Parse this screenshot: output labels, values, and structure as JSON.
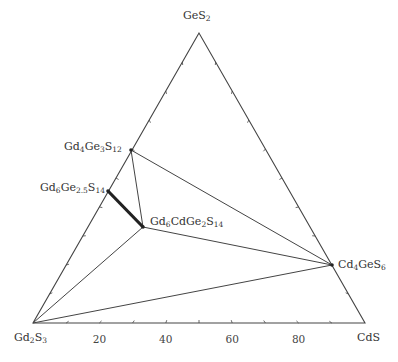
{
  "diagram": {
    "type": "ternary-phase-diagram",
    "vertices": {
      "top": {
        "id": "GeS2",
        "parts": [
          [
            "Ge",
            ""
          ],
          [
            "S",
            "2"
          ]
        ],
        "x": 199,
        "y": 33
      },
      "left": {
        "id": "Gd2S3",
        "parts": [
          [
            "Gd",
            "2"
          ],
          [
            "S",
            "3"
          ]
        ],
        "x": 33,
        "y": 323
      },
      "right": {
        "id": "CdS",
        "parts": [
          [
            "CdS",
            ""
          ]
        ],
        "x": 365,
        "y": 323
      }
    },
    "bottom_axis_ticks": [
      "20",
      "40",
      "60",
      "80"
    ],
    "tick_count": 9,
    "phases": [
      {
        "id": "Gd4Ge3S12",
        "parts": [
          [
            "Gd",
            "4"
          ],
          [
            "Ge",
            "3"
          ],
          [
            "S",
            "12"
          ]
        ],
        "x": 131,
        "y": 150,
        "label_x": 64,
        "label_y": 141
      },
      {
        "id": "Gd6Ge2.5S14",
        "parts": [
          [
            "Gd",
            "6"
          ],
          [
            "Ge",
            "2.5"
          ],
          [
            "S",
            "14"
          ]
        ],
        "x": 108,
        "y": 191,
        "label_x": 40,
        "label_y": 182
      },
      {
        "id": "Gd6CdGe2S14",
        "parts": [
          [
            "Gd",
            "6"
          ],
          [
            "CdGe",
            "2"
          ],
          [
            "S",
            "14"
          ]
        ],
        "x": 143,
        "y": 227,
        "label_x": 150,
        "label_y": 216
      },
      {
        "id": "Cd4GeS6",
        "parts": [
          [
            "Cd",
            "4"
          ],
          [
            "GeS",
            "6"
          ]
        ],
        "x": 332,
        "y": 265,
        "label_x": 338,
        "label_y": 259
      }
    ],
    "tie_lines": [
      {
        "from": "Gd4Ge3S12",
        "to": "Cd4GeS6",
        "weight": "thin"
      },
      {
        "from": "Gd4Ge3S12",
        "to": "Gd6CdGe2S14",
        "weight": "thin"
      },
      {
        "from": "Gd6CdGe2S14",
        "to": "Cd4GeS6",
        "weight": "thin"
      },
      {
        "from": "Gd6CdGe2S14",
        "to": "Gd2S3",
        "weight": "thin"
      },
      {
        "from": "Gd2S3",
        "to": "Cd4GeS6",
        "weight": "thin"
      },
      {
        "from": "Gd6Ge2.5S14",
        "to": "Gd6CdGe2S14",
        "weight": "thick"
      }
    ],
    "colors": {
      "line": "#444444",
      "thick_line": "#222222",
      "text": "#333333"
    }
  }
}
